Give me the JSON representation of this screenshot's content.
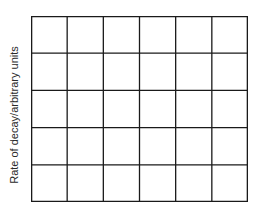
{
  "chart_data": {
    "type": "line",
    "title": "",
    "xlabel": "",
    "ylabel": "Rate of decay/arbitrary units",
    "grid": true,
    "grid_columns": 6,
    "grid_rows": 5,
    "series": [],
    "note": "Empty grid for plotting; no data points, ticks or tick labels shown"
  },
  "colors": {
    "grid_line": "#1a1a1a",
    "label": "#2a2a2a",
    "background": "#ffffff"
  }
}
